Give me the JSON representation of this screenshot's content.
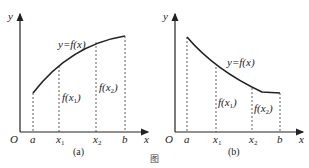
{
  "figures": [
    {
      "id": "a",
      "caption": "(a)",
      "curve_label": "y=f(x)",
      "curve_shape": "increasing, concave down",
      "axis_labels": {
        "x": "x",
        "y": "y",
        "origin": "O"
      },
      "x_ticks": [
        "a",
        "x1",
        "x2",
        "b"
      ],
      "value_labels": [
        "f(x1)",
        "f(x2)"
      ]
    },
    {
      "id": "b",
      "caption": "(b)",
      "curve_label": "y=f(x)",
      "curve_shape": "decreasing, concave up",
      "axis_labels": {
        "x": "x",
        "y": "y",
        "origin": "O"
      },
      "x_ticks": [
        "a",
        "x1",
        "x2",
        "b"
      ],
      "value_labels": [
        "f(x1)",
        "f(x2)"
      ]
    }
  ],
  "figure_caption": "图"
}
